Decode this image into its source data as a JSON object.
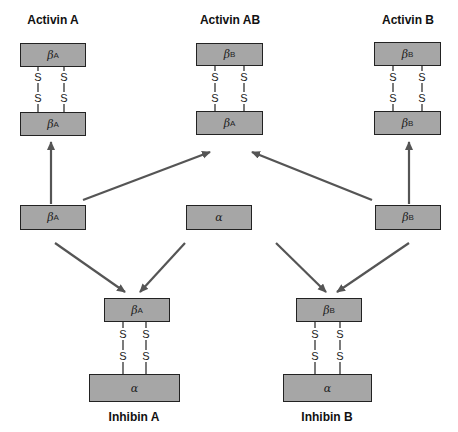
{
  "labels": {
    "activin_a": "Activin A",
    "activin_ab": "Activin AB",
    "activin_b": "Activin B",
    "inhibin_a": "Inhibin A",
    "inhibin_b": "Inhibin B"
  },
  "subunits": {
    "beta": "β",
    "alpha": "α",
    "sub_a": "A",
    "sub_b": "B"
  },
  "bond": "S",
  "colors": {
    "box_fill": "#a6a6a6",
    "border": "#222222",
    "arrow": "#555555"
  }
}
